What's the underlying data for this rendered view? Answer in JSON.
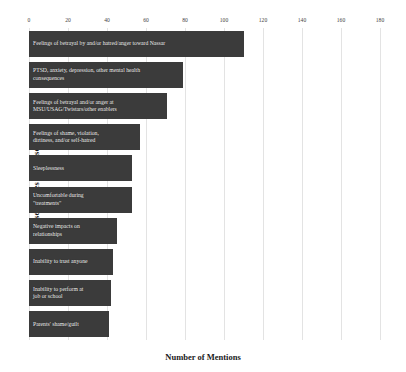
{
  "chart_data": {
    "type": "bar",
    "orientation": "horizontal",
    "title": "",
    "xlabel": "Number of Mentions",
    "ylabel": "Consequences of Abuse",
    "xlim": [
      0,
      180
    ],
    "xticks": [
      0,
      20,
      40,
      60,
      80,
      100,
      120,
      140,
      160,
      180
    ],
    "grid": true,
    "legend": null,
    "bar_color": "#3b3b3b",
    "label_color": "#f2f2f2",
    "categories": [
      "Feelings of betrayal by and/or hatred/anger toward Nassar",
      "PTSD, anxiety, depression, other mental health consequences",
      "Feelings of betrayal and/or anger at MSU/USAG/Twistars/other enablers",
      "Feelings of shame, violation, dirtiness, and/or self-hatred",
      "Sleeplessness",
      "Uncomfortable during \"treatments\"",
      "Negative impacts on relationships",
      "Inability to trust anyone",
      "Inability to perform at job or school",
      "Parents' shame/guilt"
    ],
    "values": [
      110,
      79,
      71,
      57,
      53,
      53,
      45,
      43,
      42,
      41
    ],
    "bar_labels": [
      "Feelings of betrayal by and/or hatred/anger toward Nassar",
      "PTSD, anxiety, depression, other mental health\nconsequences",
      "Feelings of betrayal and/or anger at\nMSU/USAG/Twistars/other enablers",
      "Feelings of shame, violation,\ndirtiness, and/or self-hatred",
      "Sleeplessness",
      "Uncomfortable during\n\"treatments\"",
      "Negative impacts on\nrelationships",
      "Inability to trust anyone",
      "Inability to perform at\njob or school",
      "Parents' shame/guilt"
    ]
  }
}
